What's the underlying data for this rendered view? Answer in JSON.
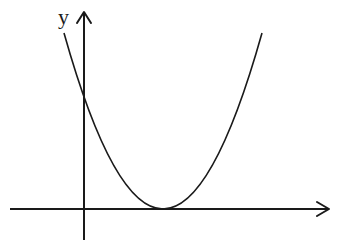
{
  "diagram": {
    "y_axis_label": "y",
    "x_axis_label": "",
    "stroke_color": "#1a1a1a",
    "background": "#ffffff",
    "curve": {
      "type": "parabola",
      "opens": "up",
      "vertex_on_x_axis": true,
      "vertex_side": "positive-x",
      "y_intercept": "positive"
    }
  }
}
